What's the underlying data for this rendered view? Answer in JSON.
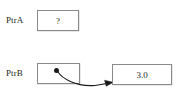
{
  "diagram": {
    "background_color": "#ffffff",
    "line_color": "#8a8a8a",
    "text_color": "#231f20",
    "rows": [
      {
        "label": "PtrA",
        "cell_value": "?",
        "has_pointer": false
      },
      {
        "label": "PtrB",
        "cell_value": "",
        "has_pointer": true,
        "target_value": "3.0"
      }
    ],
    "labels": {
      "ptra": "PtrA",
      "ptrb": "PtrB"
    },
    "values": {
      "ptra_cell": "?",
      "target_cell": "3.0"
    },
    "pointer": {
      "dot_color": "#1a1a1a",
      "arrow_color": "#1a1a1a",
      "description": "curved arrow from PtrB cell to value cell"
    }
  }
}
